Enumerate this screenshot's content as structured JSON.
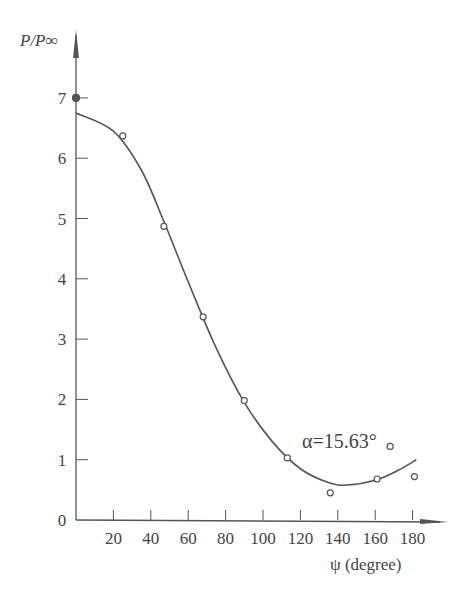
{
  "chart_data": {
    "type": "scatter",
    "title": "",
    "xlabel": "ψ (degree)",
    "ylabel": "P/P∞",
    "xlim": [
      0,
      195
    ],
    "ylim": [
      0,
      7.5
    ],
    "xticks": [
      20,
      40,
      60,
      80,
      100,
      120,
      140,
      160,
      180
    ],
    "yticks": [
      0,
      1,
      2,
      3,
      4,
      5,
      6,
      7
    ],
    "grid": false,
    "legend": null,
    "annotations": [
      {
        "text": "α=15.63°",
        "x": 120,
        "y": 1.1
      }
    ],
    "series": [
      {
        "name": "measured",
        "style": "open-circle",
        "points": [
          {
            "x": 0,
            "y": 7.0,
            "filled": true
          },
          {
            "x": 25,
            "y": 6.37
          },
          {
            "x": 47,
            "y": 4.87
          },
          {
            "x": 68,
            "y": 3.37
          },
          {
            "x": 90,
            "y": 1.98
          },
          {
            "x": 113,
            "y": 1.03
          },
          {
            "x": 136,
            "y": 0.45
          },
          {
            "x": 161,
            "y": 0.68
          },
          {
            "x": 168,
            "y": 1.22
          },
          {
            "x": 181,
            "y": 0.72
          }
        ]
      },
      {
        "name": "fitted curve",
        "style": "smooth-line",
        "points": [
          {
            "x": 0,
            "y": 6.75
          },
          {
            "x": 20,
            "y": 6.45
          },
          {
            "x": 35,
            "y": 5.8
          },
          {
            "x": 47,
            "y": 4.95
          },
          {
            "x": 60,
            "y": 3.95
          },
          {
            "x": 75,
            "y": 2.85
          },
          {
            "x": 90,
            "y": 1.95
          },
          {
            "x": 105,
            "y": 1.3
          },
          {
            "x": 120,
            "y": 0.85
          },
          {
            "x": 135,
            "y": 0.62
          },
          {
            "x": 145,
            "y": 0.58
          },
          {
            "x": 160,
            "y": 0.66
          },
          {
            "x": 172,
            "y": 0.82
          },
          {
            "x": 182,
            "y": 1.0
          }
        ]
      }
    ]
  },
  "labels": {
    "y_axis": "P/P∞",
    "x_axis": "ψ (degree)",
    "annotation": "α=15.63°"
  }
}
